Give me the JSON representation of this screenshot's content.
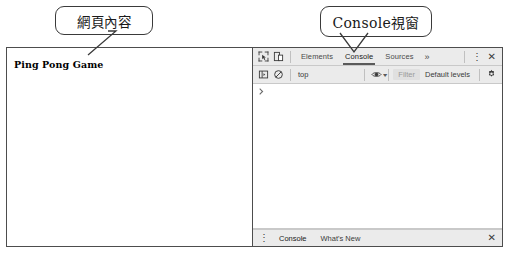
{
  "annotations": {
    "webpage_callout": "網頁內容",
    "console_callout": "Console視窗"
  },
  "page_pane": {
    "heading": "Ping Pong Game"
  },
  "devtools": {
    "toolbar": {
      "inspect_icon": "inspect-element-icon",
      "device_icon": "device-toolbar-icon",
      "tabs": [
        {
          "label": "Elements",
          "active": false
        },
        {
          "label": "Console",
          "active": true
        },
        {
          "label": "Sources",
          "active": false
        }
      ],
      "overflow_label": "»",
      "more_options_label": "⋮",
      "close_label": "✕"
    },
    "filterbar": {
      "sidebar_icon": "console-sidebar-icon",
      "clear_icon": "clear-console-icon",
      "context_value": "top",
      "context_arrow": "▾",
      "eye_icon": "live-expression-eye-icon",
      "filter_placeholder": "Filter",
      "levels_value": "Default levels",
      "settings_icon": "gear-icon"
    },
    "console": {
      "prompt_symbol": "›"
    },
    "drawer": {
      "menu_label": "⋮",
      "tabs": [
        {
          "label": "Console",
          "active": true
        },
        {
          "label": "What's New",
          "active": false
        }
      ],
      "close_label": "✕"
    }
  },
  "colors": {
    "toolbar_bg": "#ebebeb",
    "frame_border": "#4d4d4d",
    "active_tab_underline": "#5a5a5a",
    "filter_field_bg": "#e0e0e0"
  }
}
